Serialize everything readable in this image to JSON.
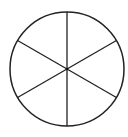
{
  "diagram": {
    "shape": "circle",
    "sectors": 6,
    "center": [
      67,
      69
    ],
    "radius": 57,
    "stroke_color": "#222222",
    "background": "#ffffff",
    "divider_angles_deg": [
      90,
      30,
      150
    ]
  }
}
